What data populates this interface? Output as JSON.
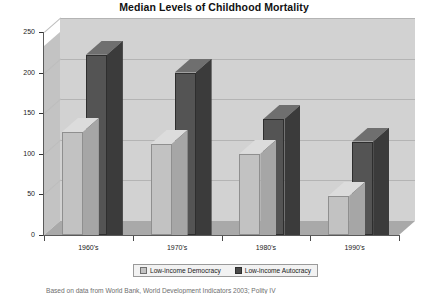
{
  "chart_data": {
    "type": "bar",
    "title": "Median Levels of Childhood Mortality",
    "xlabel": "",
    "ylabel": "Childhood deaths/1,000 live births",
    "categories": [
      "1960's",
      "1970's",
      "1980's",
      "1990's"
    ],
    "series": [
      {
        "name": "Low-income Democracy",
        "values": [
          127,
          112,
          100,
          48
        ],
        "color": "#c2c2c2"
      },
      {
        "name": "Low-income Autocracy",
        "values": [
          222,
          200,
          143,
          115
        ],
        "color": "#545454"
      }
    ],
    "ylim": [
      0,
      250
    ],
    "yticks": [
      0,
      50,
      100,
      150,
      200,
      250
    ],
    "ytick_labels": [
      "0",
      "50",
      "100",
      "150",
      "200",
      "250"
    ],
    "grid": true,
    "legend_position": "bottom",
    "three_d": true
  },
  "legend": {
    "items": [
      {
        "label": "Low-income Democracy",
        "swatch": "light"
      },
      {
        "label": "Low-income Autocracy",
        "swatch": "dark"
      }
    ]
  },
  "source_note": "Based on data from World Bank, World Development Indicators 2003; Polity IV"
}
